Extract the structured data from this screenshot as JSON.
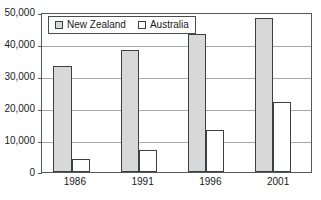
{
  "chart_data": {
    "type": "bar",
    "title": "",
    "subtitle": "",
    "xlabel": "",
    "ylabel": "",
    "categories": [
      "1986",
      "1991",
      "1996",
      "2001"
    ],
    "series": [
      {
        "name": "New Zealand",
        "values": [
          33000,
          38000,
          43000,
          48000
        ],
        "color": "#d8d8d8"
      },
      {
        "name": "Australia",
        "values": [
          4000,
          7000,
          13000,
          22000
        ],
        "color": "#ffffff"
      }
    ],
    "ylim": [
      0,
      50000
    ],
    "ytick_values": [
      0,
      10000,
      20000,
      30000,
      40000,
      50000
    ],
    "ytick_labels": [
      "0",
      "10,000",
      "20,000",
      "30,000",
      "40,000",
      "50,000"
    ],
    "grid": true,
    "legend_position": "top-left",
    "annotations": []
  },
  "legend": {
    "entries": [
      {
        "label": "New Zealand"
      },
      {
        "label": "Australia"
      }
    ]
  },
  "colors": {
    "new_zealand_fill": "#d8d8d8",
    "australia_fill": "#ffffff",
    "bar_outline": "#3d4042",
    "gridline": "#a8abad",
    "axis": "#55595c",
    "text": "#1a1a1a",
    "background": "#ffffff"
  }
}
